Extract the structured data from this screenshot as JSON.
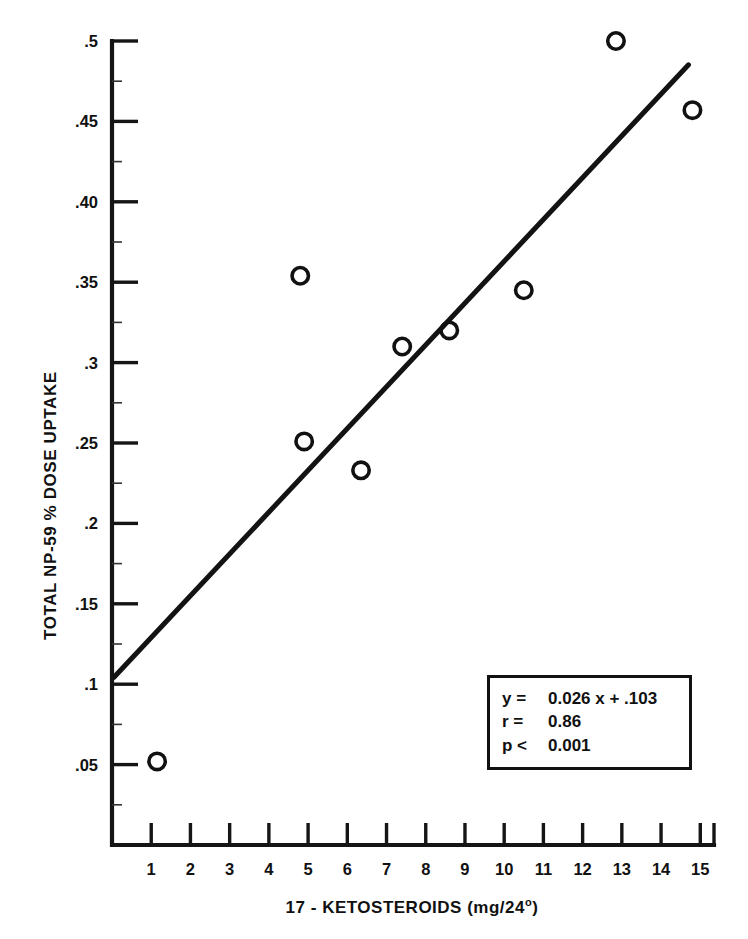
{
  "figure": {
    "background_color": "#ffffff",
    "ink_color": "#111111"
  },
  "axes": {
    "x_label_prefix": "17 - KETOSTEROIDS (mg/24",
    "x_label_degree": "o",
    "x_label_suffix": ")",
    "y_label": "TOTAL NP-59 % DOSE UPTAKE"
  },
  "stats_box": {
    "rows": [
      {
        "key": "y =",
        "value": "0.026 x + .103"
      },
      {
        "key": "r =",
        "value": "0.86"
      },
      {
        "key": "p <",
        "value": "0.001"
      }
    ]
  },
  "chart_data": {
    "type": "scatter",
    "title": "",
    "xlabel": "17 - KETOSTEROIDS (mg/24°)",
    "ylabel": "TOTAL NP-59 % DOSE UPTAKE",
    "xlim": [
      0,
      15.35
    ],
    "ylim": [
      0,
      0.5
    ],
    "grid": false,
    "legend": null,
    "x_ticks": [
      1,
      2,
      3,
      4,
      5,
      6,
      7,
      8,
      9,
      10,
      11,
      12,
      13,
      14,
      15
    ],
    "x_tick_labels": [
      "1",
      "2",
      "3",
      "4",
      "5",
      "6",
      "7",
      "8",
      "9",
      "10",
      "11",
      "12",
      "13",
      "14",
      "15"
    ],
    "y_ticks": [
      0.05,
      0.1,
      0.15,
      0.2,
      0.25,
      0.3,
      0.35,
      0.4,
      0.45,
      0.5
    ],
    "y_tick_labels": [
      ".05",
      ".1",
      ".15",
      ".2",
      ".25",
      ".3",
      ".35",
      ".40",
      ".45",
      ".5"
    ],
    "y_minor_ticks": [
      0.025,
      0.075,
      0.125,
      0.175,
      0.225,
      0.275,
      0.325,
      0.375,
      0.425,
      0.475
    ],
    "marker": "open-circle",
    "points": [
      {
        "x": 1.15,
        "y": 0.052
      },
      {
        "x": 4.8,
        "y": 0.354
      },
      {
        "x": 4.9,
        "y": 0.251
      },
      {
        "x": 6.35,
        "y": 0.233
      },
      {
        "x": 7.4,
        "y": 0.31
      },
      {
        "x": 8.6,
        "y": 0.32
      },
      {
        "x": 10.5,
        "y": 0.345
      },
      {
        "x": 12.85,
        "y": 0.5
      },
      {
        "x": 14.8,
        "y": 0.457
      }
    ],
    "fit_line": {
      "equation": "y = 0.026 x + .103",
      "slope": 0.026,
      "intercept": 0.103,
      "r": 0.86,
      "p_text": "p < 0.001",
      "x_start": 0.05,
      "x_end": 14.7
    }
  }
}
